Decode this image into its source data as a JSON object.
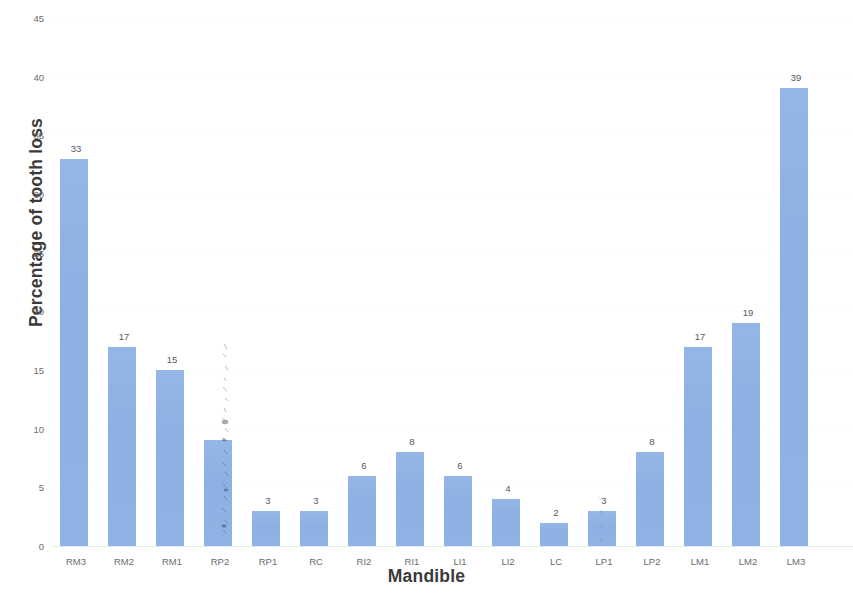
{
  "chart_data": {
    "type": "bar",
    "title": "",
    "xlabel": "Mandible",
    "ylabel": "Percentage of tooth loss",
    "categories": [
      "RM3",
      "RM2",
      "RM1",
      "RP2",
      "RP1",
      "RC",
      "RI2",
      "RI1",
      "LI1",
      "LI2",
      "LC",
      "LP1",
      "LP2",
      "LM1",
      "LM2",
      "LM3"
    ],
    "values": [
      33,
      17,
      15,
      9,
      3,
      3,
      6,
      8,
      6,
      4,
      2,
      3,
      8,
      17,
      19,
      39
    ],
    "value_labels": [
      "33",
      "17",
      "15",
      "",
      "3",
      "3",
      "6",
      "8",
      "6",
      "4",
      "2",
      "3",
      "8",
      "17",
      "19",
      "39"
    ],
    "ylim": [
      0,
      45
    ],
    "yticks": [
      0,
      5,
      10,
      15,
      20,
      25,
      30,
      35,
      40,
      45
    ],
    "ytick_labels": [
      "0",
      "5",
      "10",
      "15",
      "20",
      "25",
      "30",
      "35",
      "40",
      "45"
    ],
    "grid": true,
    "legend": false,
    "bar_color": "#8fb3e4",
    "background_color": "#ffffff"
  }
}
